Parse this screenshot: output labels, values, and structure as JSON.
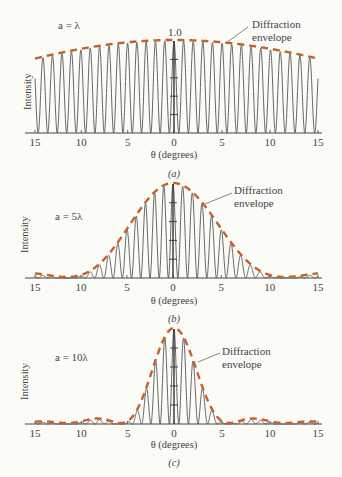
{
  "chart_data": [
    {
      "type": "line",
      "panel_label": "(a)",
      "annotation": "a = λ",
      "slit_width_in_wavelengths": 1,
      "fringe_spacing_deg": 1,
      "xlabel": "θ (degrees)",
      "ylabel": "Intensity",
      "x_tick_labels": [
        "15",
        "10",
        "5",
        "0",
        "5",
        "10",
        "15"
      ],
      "x_tick_values": [
        -15,
        -10,
        -5,
        0,
        5,
        10,
        15
      ],
      "xlim": [
        -15,
        15
      ],
      "ylim": [
        0,
        1.0
      ],
      "y_peak_label": "1.0",
      "envelope_label": [
        "Diffraction",
        "envelope"
      ],
      "series": [
        {
          "name": "Intensity",
          "style": "solid",
          "color": "#555555"
        },
        {
          "name": "Diffraction envelope",
          "style": "dashed",
          "color": "#c8602e"
        }
      ]
    },
    {
      "type": "line",
      "panel_label": "(b)",
      "annotation": "a = 5λ",
      "slit_width_in_wavelengths": 5,
      "fringe_spacing_deg": 1,
      "xlabel": "θ (degrees)",
      "ylabel": "Intensity",
      "x_tick_labels": [
        "15",
        "10",
        "5",
        "0",
        "5",
        "10",
        "15"
      ],
      "x_tick_values": [
        -15,
        -10,
        -5,
        0,
        5,
        10,
        15
      ],
      "xlim": [
        -15,
        15
      ],
      "ylim": [
        0,
        1.0
      ],
      "envelope_label": [
        "Diffraction",
        "envelope"
      ],
      "series": [
        {
          "name": "Intensity",
          "style": "solid",
          "color": "#555555"
        },
        {
          "name": "Diffraction envelope",
          "style": "dashed",
          "color": "#c8602e"
        }
      ]
    },
    {
      "type": "line",
      "panel_label": "(c)",
      "annotation": "a = 10λ",
      "slit_width_in_wavelengths": 10,
      "fringe_spacing_deg": 1,
      "xlabel": "θ (degrees)",
      "ylabel": "Intensity",
      "x_tick_labels": [
        "15",
        "10",
        "5",
        "0",
        "5",
        "10",
        "15"
      ],
      "x_tick_values": [
        -15,
        -10,
        -5,
        0,
        5,
        10,
        15
      ],
      "xlim": [
        -15,
        15
      ],
      "ylim": [
        0,
        1.0
      ],
      "envelope_label": [
        "Diffraction",
        "envelope"
      ],
      "series": [
        {
          "name": "Intensity",
          "style": "solid",
          "color": "#555555"
        },
        {
          "name": "Diffraction envelope",
          "style": "dashed",
          "color": "#c8602e"
        }
      ]
    }
  ],
  "colors": {
    "envelope": "#c8602e",
    "curve": "#555555",
    "axis": "#444444"
  }
}
